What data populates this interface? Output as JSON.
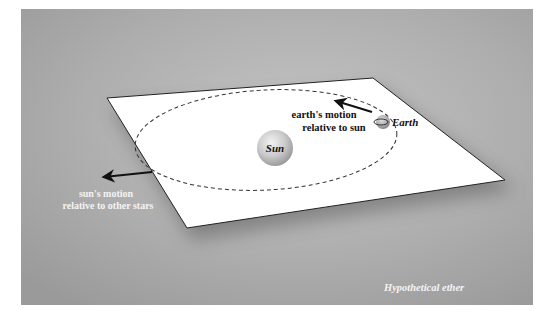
{
  "figure": {
    "background_color": "#ffffff",
    "panel_color": "#a9a9a9",
    "plane_color": "#ffffff",
    "caption": "Hypothetical ether",
    "labels": {
      "sun": "Sun",
      "earth": "Earth",
      "earth_motion_line1": "earth's motion",
      "earth_motion_line2": "relative to sun",
      "sun_motion_line1": "sun's motion",
      "sun_motion_line2": "relative to other stars"
    }
  }
}
